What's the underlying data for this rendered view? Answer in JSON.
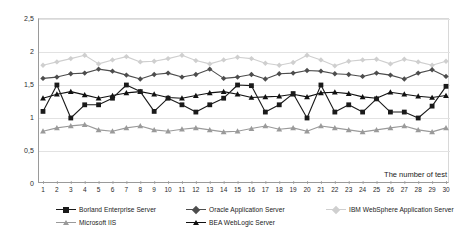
{
  "chart_data": {
    "type": "line",
    "title": "",
    "xlabel": "The number of test",
    "ylabel": "T_RPT, c",
    "ylabel_main": "T",
    "ylabel_sub": "RPT, c",
    "xlim": [
      1,
      30
    ],
    "ylim": [
      0,
      2.5
    ],
    "ytick_labels": [
      "2,5",
      "2",
      "1,5",
      "1",
      "0,5",
      "0"
    ],
    "ytick_values": [
      2.5,
      2.0,
      1.5,
      1.0,
      0.5,
      0.0
    ],
    "grid": true,
    "grid_axis": "y",
    "legend_position": "bottom",
    "x": [
      1,
      2,
      3,
      4,
      5,
      6,
      7,
      8,
      9,
      10,
      11,
      12,
      13,
      14,
      15,
      16,
      17,
      18,
      19,
      20,
      21,
      22,
      23,
      24,
      25,
      26,
      27,
      28,
      29,
      30
    ],
    "xtick_labels": [
      "1",
      "2",
      "3",
      "4",
      "5",
      "6",
      "7",
      "8",
      "9",
      "10",
      "11",
      "12",
      "13",
      "14",
      "15",
      "16",
      "17",
      "18",
      "19",
      "20",
      "21",
      "22",
      "23",
      "24",
      "25",
      "26",
      "27",
      "28",
      "29",
      "30"
    ],
    "series": [
      {
        "name": "Borland Enterprise Server",
        "marker": "square",
        "color": "#1a1a1a",
        "values": [
          1.1,
          1.5,
          1.0,
          1.2,
          1.2,
          1.3,
          1.5,
          1.4,
          1.1,
          1.3,
          1.2,
          1.09,
          1.2,
          1.3,
          1.5,
          1.49,
          1.09,
          1.2,
          1.37,
          1.0,
          1.5,
          1.09,
          1.2,
          1.09,
          1.29,
          1.09,
          1.09,
          1.0,
          1.18,
          1.48
        ]
      },
      {
        "name": "Oracle Application Server",
        "marker": "diamond",
        "color": "#4d4d4d",
        "values": [
          1.6,
          1.62,
          1.67,
          1.68,
          1.74,
          1.71,
          1.65,
          1.59,
          1.66,
          1.68,
          1.62,
          1.66,
          1.74,
          1.6,
          1.62,
          1.66,
          1.59,
          1.67,
          1.68,
          1.72,
          1.71,
          1.67,
          1.66,
          1.63,
          1.68,
          1.65,
          1.59,
          1.68,
          1.73,
          1.63
        ]
      },
      {
        "name": "IBM WebSphere Application Server",
        "marker": "diamond",
        "color": "#cfcfcf",
        "values": [
          1.8,
          1.85,
          1.9,
          1.95,
          1.82,
          1.88,
          1.93,
          1.85,
          1.86,
          1.9,
          1.95,
          1.87,
          1.82,
          1.88,
          1.92,
          1.9,
          1.83,
          1.8,
          1.84,
          1.95,
          1.88,
          1.79,
          1.86,
          1.88,
          1.89,
          1.82,
          1.89,
          1.85,
          1.8,
          1.86
        ]
      },
      {
        "name": "Microsoft IIS",
        "marker": "triangle",
        "color": "#9a9a9a",
        "values": [
          0.8,
          0.85,
          0.88,
          0.9,
          0.82,
          0.8,
          0.85,
          0.88,
          0.82,
          0.8,
          0.83,
          0.85,
          0.82,
          0.79,
          0.8,
          0.84,
          0.88,
          0.83,
          0.85,
          0.8,
          0.88,
          0.85,
          0.82,
          0.79,
          0.82,
          0.85,
          0.88,
          0.82,
          0.79,
          0.85
        ]
      },
      {
        "name": "BEA WebLogic Server",
        "marker": "triangle",
        "color": "#111111",
        "values": [
          1.3,
          1.36,
          1.4,
          1.35,
          1.3,
          1.34,
          1.38,
          1.4,
          1.36,
          1.31,
          1.3,
          1.34,
          1.38,
          1.4,
          1.36,
          1.31,
          1.32,
          1.33,
          1.36,
          1.32,
          1.38,
          1.39,
          1.37,
          1.32,
          1.3,
          1.39,
          1.36,
          1.33,
          1.31,
          1.34
        ]
      }
    ]
  },
  "axis": {
    "y_title_main": "T",
    "y_title_sub": "RPT, c",
    "x_title": "The number of test"
  },
  "legend": {
    "rows": [
      [
        {
          "label": "Borland Enterprise Server",
          "marker": "square",
          "color": "#1a1a1a"
        },
        {
          "label": "Oracle Application Server",
          "marker": "diamond",
          "color": "#4d4d4d"
        },
        {
          "label": "IBM WebSphere Application Server",
          "marker": "diamond",
          "color": "#cfcfcf"
        }
      ],
      [
        {
          "label": "Microsoft IIS",
          "marker": "triangle",
          "color": "#9a9a9a"
        },
        {
          "label": "BEA WebLogic Server",
          "marker": "triangle",
          "color": "#111111"
        }
      ]
    ],
    "row_offsets": [
      [
        18,
        148,
        288
      ],
      [
        18,
        148
      ]
    ]
  },
  "colors": {
    "grid": "#e2e2e2",
    "axis": "#9a9a9a",
    "text": "#1a1a1a",
    "background": "#ffffff"
  }
}
